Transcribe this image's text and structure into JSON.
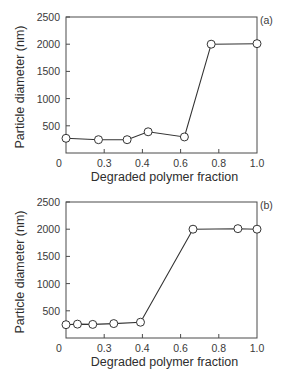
{
  "chart_data": [
    {
      "type": "line",
      "panel_label": "(a)",
      "title": "",
      "xlabel": "Degraded polymer fraction",
      "ylabel": "Particle diameter (nm)",
      "xlim": [
        0,
        1.0
      ],
      "ylim": [
        0,
        2500
      ],
      "x_ticks": [
        0,
        0.2,
        0.4,
        0.6,
        0.8,
        1.0
      ],
      "x_tick_labels": [
        "0",
        "0.3",
        "0.4",
        "0.6",
        "0.8",
        "1.0"
      ],
      "y_ticks": [
        500,
        1000,
        1500,
        2000,
        2500
      ],
      "y_tick_labels": [
        "500",
        "1000",
        "1500",
        "2000",
        "2500"
      ],
      "grid": false,
      "marker": "open-circle",
      "series": [
        {
          "name": "Particle diameter",
          "x": [
            0.0,
            0.17,
            0.32,
            0.43,
            0.62,
            0.76,
            1.0
          ],
          "y": [
            270,
            245,
            245,
            390,
            295,
            2000,
            2010
          ]
        }
      ]
    },
    {
      "type": "line",
      "panel_label": "(b)",
      "title": "",
      "xlabel": "Degraded polymer fraction",
      "ylabel": "Particle diameter (nm)",
      "xlim": [
        0,
        1.0
      ],
      "ylim": [
        0,
        2500
      ],
      "x_ticks": [
        0,
        0.2,
        0.4,
        0.6,
        0.8,
        1.0
      ],
      "x_tick_labels": [
        "0",
        "0.3",
        "0.4",
        "0.6",
        "0.8",
        "1.0"
      ],
      "y_ticks": [
        500,
        1000,
        1500,
        2000,
        2500
      ],
      "y_tick_labels": [
        "500",
        "1000",
        "1500",
        "2000",
        "2500"
      ],
      "grid": false,
      "marker": "open-circle",
      "series": [
        {
          "name": "Particle diameter",
          "x": [
            0.0,
            0.06,
            0.14,
            0.25,
            0.39,
            0.665,
            0.9,
            1.0
          ],
          "y": [
            245,
            255,
            250,
            265,
            290,
            2000,
            2010,
            2000
          ]
        }
      ]
    }
  ]
}
